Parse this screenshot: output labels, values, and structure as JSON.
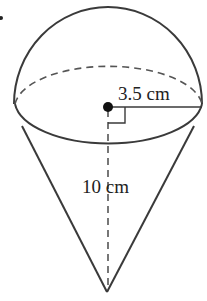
{
  "figure": {
    "labels": {
      "radius": "3.5 cm",
      "height": "10 cm"
    },
    "geometry": {
      "center": [
        108,
        107
      ],
      "radius_px": 94,
      "ellipse_ry": 42,
      "dome_top_y": 7,
      "apex": [
        107,
        292
      ]
    },
    "colors": {
      "stroke": "#3a3a3a",
      "background": "#ffffff"
    }
  }
}
